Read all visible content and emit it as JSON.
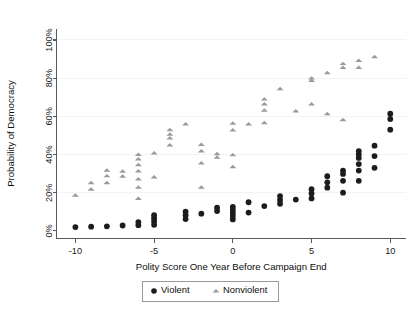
{
  "chart_data": {
    "type": "scatter",
    "title": "",
    "xlabel": "Polity Score One Year Before Campaign End",
    "ylabel": "Probability of Democracy",
    "xlim": [
      -11.2,
      11.0
    ],
    "ylim": [
      -0.04,
      1.06
    ],
    "grid": false,
    "xticks": [
      -10,
      -5,
      0,
      5,
      10
    ],
    "xtick_labels": [
      "-10",
      "-5",
      "0",
      "5",
      "10"
    ],
    "yticks": [
      0,
      0.2,
      0.4,
      0.6,
      0.8,
      1.0
    ],
    "ytick_labels": [
      "0%",
      "20%",
      "40%",
      "60%",
      "80%",
      "100%"
    ],
    "legend_position": "below-center",
    "series": [
      {
        "name": "Violent",
        "marker": "circle",
        "color": "#1c1c1c",
        "points": [
          [
            -10.0,
            0.02
          ],
          [
            -9.0,
            0.022
          ],
          [
            -8.0,
            0.024
          ],
          [
            -7.0,
            0.028
          ],
          [
            -6.0,
            0.03
          ],
          [
            -6.0,
            0.046
          ],
          [
            -5.0,
            0.032
          ],
          [
            -5.0,
            0.05
          ],
          [
            -5.0,
            0.066
          ],
          [
            -5.0,
            0.082
          ],
          [
            -3.0,
            0.062
          ],
          [
            -3.0,
            0.082
          ],
          [
            -3.0,
            0.1
          ],
          [
            -2.0,
            0.09
          ],
          [
            -1.0,
            0.104
          ],
          [
            -1.0,
            0.122
          ],
          [
            0.0,
            0.06
          ],
          [
            0.0,
            0.078
          ],
          [
            0.0,
            0.094
          ],
          [
            0.0,
            0.11
          ],
          [
            0.0,
            0.126
          ],
          [
            1.0,
            0.096
          ],
          [
            1.0,
            0.15
          ],
          [
            2.0,
            0.13
          ],
          [
            3.0,
            0.142
          ],
          [
            3.0,
            0.162
          ],
          [
            3.0,
            0.182
          ],
          [
            4.0,
            0.164
          ],
          [
            5.0,
            0.17
          ],
          [
            5.0,
            0.196
          ],
          [
            5.0,
            0.218
          ],
          [
            6.0,
            0.226
          ],
          [
            6.0,
            0.254
          ],
          [
            6.0,
            0.286
          ],
          [
            7.0,
            0.2
          ],
          [
            7.0,
            0.262
          ],
          [
            7.0,
            0.298
          ],
          [
            7.0,
            0.316
          ],
          [
            8.0,
            0.262
          ],
          [
            8.0,
            0.316
          ],
          [
            8.0,
            0.35
          ],
          [
            8.0,
            0.382
          ],
          [
            8.0,
            0.4
          ],
          [
            8.0,
            0.418
          ],
          [
            9.0,
            0.33
          ],
          [
            9.0,
            0.392
          ],
          [
            9.0,
            0.446
          ],
          [
            10.0,
            0.53
          ],
          [
            10.0,
            0.586
          ],
          [
            10.0,
            0.614
          ]
        ]
      },
      {
        "name": "Nonviolent",
        "marker": "triangle",
        "color": "#9a9a9a",
        "points": [
          [
            -10.0,
            0.186
          ],
          [
            -9.0,
            0.218
          ],
          [
            -9.0,
            0.252
          ],
          [
            -8.0,
            0.252
          ],
          [
            -8.0,
            0.288
          ],
          [
            -8.0,
            0.318
          ],
          [
            -7.0,
            0.286
          ],
          [
            -7.0,
            0.312
          ],
          [
            -6.0,
            0.17
          ],
          [
            -6.0,
            0.228
          ],
          [
            -6.0,
            0.272
          ],
          [
            -6.0,
            0.314
          ],
          [
            -6.0,
            0.346
          ],
          [
            -6.0,
            0.376
          ],
          [
            -6.0,
            0.4
          ],
          [
            -5.0,
            0.282
          ],
          [
            -5.0,
            0.408
          ],
          [
            -4.0,
            0.45
          ],
          [
            -4.0,
            0.486
          ],
          [
            -4.0,
            0.506
          ],
          [
            -4.0,
            0.53
          ],
          [
            -3.0,
            0.56
          ],
          [
            -2.0,
            0.228
          ],
          [
            -2.0,
            0.356
          ],
          [
            -2.0,
            0.418
          ],
          [
            -2.0,
            0.452
          ],
          [
            -1.0,
            0.386
          ],
          [
            -1.0,
            0.404
          ],
          [
            0.0,
            0.336
          ],
          [
            0.0,
            0.398
          ],
          [
            0.0,
            0.528
          ],
          [
            0.0,
            0.564
          ],
          [
            1.0,
            0.56
          ],
          [
            2.0,
            0.566
          ],
          [
            2.0,
            0.632
          ],
          [
            2.0,
            0.664
          ],
          [
            2.0,
            0.69
          ],
          [
            3.0,
            0.744
          ],
          [
            4.0,
            0.628
          ],
          [
            5.0,
            0.664
          ],
          [
            5.0,
            0.788
          ],
          [
            5.0,
            0.8
          ],
          [
            6.0,
            0.614
          ],
          [
            6.0,
            0.828
          ],
          [
            7.0,
            0.582
          ],
          [
            7.0,
            0.856
          ],
          [
            7.0,
            0.876
          ],
          [
            8.0,
            0.856
          ],
          [
            8.0,
            0.892
          ],
          [
            9.0,
            0.912
          ]
        ]
      }
    ]
  },
  "legend": {
    "items": [
      {
        "label": "Violent",
        "marker": "circle"
      },
      {
        "label": "Nonviolent",
        "marker": "triangle"
      }
    ]
  },
  "colors": {
    "violent": "#1c1c1c",
    "nonviolent": "#9a9a9a",
    "axis": "#5a5a5a",
    "text": "#0d0d0d",
    "background": "#ffffff"
  }
}
